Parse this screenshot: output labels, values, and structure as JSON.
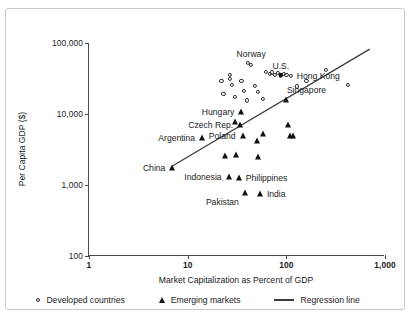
{
  "chart_data": {
    "type": "scatter",
    "title": "",
    "xlabel": "Market Capitalization as Percent of GDP",
    "ylabel": "Per Capita GDP ($)",
    "xscale": "log",
    "yscale": "log",
    "xlim": [
      1,
      1000
    ],
    "ylim": [
      100,
      100000
    ],
    "xticks": [
      "1",
      "10",
      "100",
      "1,000"
    ],
    "yticks": [
      "100",
      "1,000",
      "10,000",
      "100,000"
    ],
    "grid": false,
    "legend_position": "below-axis",
    "series": [
      {
        "name": "Developed countries",
        "marker": "open-circle",
        "points": [
          {
            "x": 22,
            "y": 29000
          },
          {
            "x": 23,
            "y": 19000
          },
          {
            "x": 27,
            "y": 36000
          },
          {
            "x": 27,
            "y": 31000
          },
          {
            "x": 28,
            "y": 26000
          },
          {
            "x": 30,
            "y": 17500
          },
          {
            "x": 35,
            "y": 29000
          },
          {
            "x": 37,
            "y": 21000
          },
          {
            "x": 40,
            "y": 15500
          },
          {
            "x": 41,
            "y": 52000
          },
          {
            "x": 44,
            "y": 49000
          },
          {
            "x": 48,
            "y": 25000
          },
          {
            "x": 52,
            "y": 20500
          },
          {
            "x": 58,
            "y": 16500
          },
          {
            "x": 62,
            "y": 39000
          },
          {
            "x": 68,
            "y": 37000
          },
          {
            "x": 72,
            "y": 38500
          },
          {
            "x": 76,
            "y": 36000
          },
          {
            "x": 82,
            "y": 37500
          },
          {
            "x": 88,
            "y": 35500
          },
          {
            "x": 95,
            "y": 37000
          },
          {
            "x": 100,
            "y": 36000
          },
          {
            "x": 112,
            "y": 34500
          },
          {
            "x": 128,
            "y": 24500
          },
          {
            "x": 160,
            "y": 29000
          },
          {
            "x": 250,
            "y": 42000
          },
          {
            "x": 420,
            "y": 25500
          }
        ]
      },
      {
        "name": "Emerging markets",
        "marker": "filled-triangle",
        "points": [
          {
            "x": 7,
            "y": 1750
          },
          {
            "x": 14,
            "y": 4600
          },
          {
            "x": 24,
            "y": 2600
          },
          {
            "x": 26,
            "y": 1300
          },
          {
            "x": 30,
            "y": 7700
          },
          {
            "x": 31,
            "y": 2650
          },
          {
            "x": 33,
            "y": 1250
          },
          {
            "x": 34,
            "y": 6900
          },
          {
            "x": 35,
            "y": 10800
          },
          {
            "x": 36,
            "y": 4900
          },
          {
            "x": 38,
            "y": 780
          },
          {
            "x": 50,
            "y": 4200
          },
          {
            "x": 52,
            "y": 2500
          },
          {
            "x": 54,
            "y": 740
          },
          {
            "x": 58,
            "y": 5200
          },
          {
            "x": 100,
            "y": 15500
          },
          {
            "x": 103,
            "y": 6900
          },
          {
            "x": 108,
            "y": 4900
          },
          {
            "x": 118,
            "y": 4900
          }
        ]
      }
    ],
    "annotations": [
      {
        "label": "Norway",
        "x": 44,
        "y": 52000,
        "anchor": "above"
      },
      {
        "label": "U.S.",
        "x": 88,
        "y": 35500,
        "anchor": "above"
      },
      {
        "label": "Hong Kong",
        "x": 420,
        "y": 25500,
        "anchor": "above-left"
      },
      {
        "label": "Singapore",
        "x": 160,
        "y": 29000,
        "anchor": "below"
      },
      {
        "label": "Hungary",
        "x": 35,
        "y": 10800,
        "anchor": "left"
      },
      {
        "label": "Czech Rep.",
        "x": 34,
        "y": 6900,
        "anchor": "left"
      },
      {
        "label": "Poland",
        "x": 36,
        "y": 4900,
        "anchor": "left"
      },
      {
        "label": "Argentina",
        "x": 14,
        "y": 4600,
        "anchor": "left"
      },
      {
        "label": "China",
        "x": 7,
        "y": 1750,
        "anchor": "left"
      },
      {
        "label": "Indonesia",
        "x": 26,
        "y": 1300,
        "anchor": "left"
      },
      {
        "label": "Philippines",
        "x": 33,
        "y": 1250,
        "anchor": "right"
      },
      {
        "label": "Pakistan",
        "x": 38,
        "y": 780,
        "anchor": "below-left"
      },
      {
        "label": "India",
        "x": 54,
        "y": 740,
        "anchor": "right"
      }
    ],
    "regression_line": {
      "name": "Regression line",
      "x_start": 7,
      "y_start": 1850,
      "x_end": 700,
      "y_end": 82000
    }
  },
  "legend": {
    "developed": "Developed countries",
    "emerging": "Emerging markets",
    "regression": "Regression line"
  },
  "colors": {
    "marker_stroke": "#2a2a2a",
    "triangle_fill": "#111111",
    "axis": "#4a4a4a",
    "regression": "#3a3a3a",
    "frame": "#c9c9c9",
    "background": "#ffffff",
    "text": "#1a1a1a"
  }
}
